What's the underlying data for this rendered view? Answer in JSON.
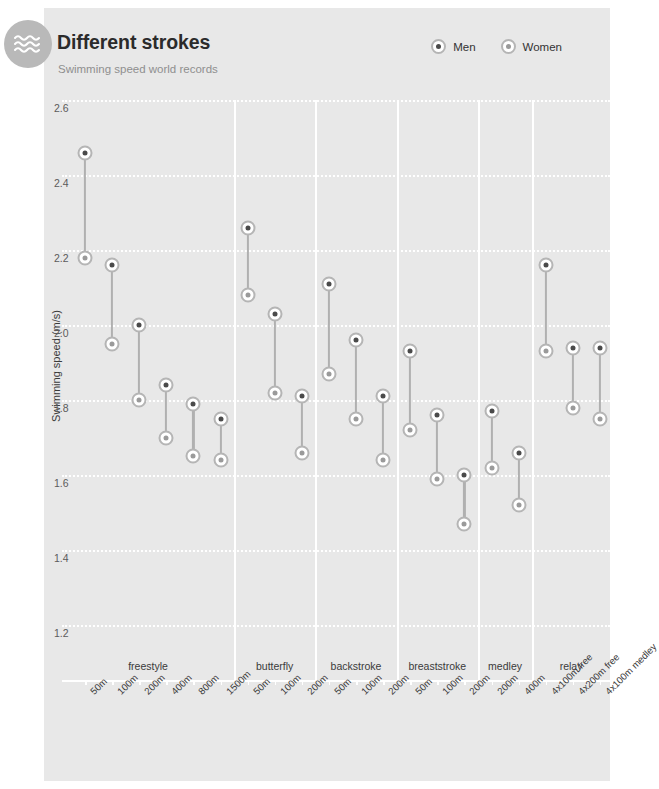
{
  "header": {
    "title": "Different strokes",
    "subtitle": "Swimming speed world records",
    "logo_icon": "waves-icon"
  },
  "legend": {
    "position": "top-right",
    "items": [
      {
        "label": "Men",
        "marker": "filled-dot-circle-icon",
        "color": "#4a4a4a"
      },
      {
        "label": "Women",
        "marker": "light-dot-circle-icon",
        "color": "#9a9a9a"
      }
    ]
  },
  "chart_data": {
    "type": "scatter",
    "title": "Different strokes",
    "subtitle": "Swimming speed world records",
    "xlabel": "",
    "ylabel": "Swimming speed (m/s)",
    "ylim": [
      1.1,
      2.65
    ],
    "yticks": [
      2.6,
      2.4,
      2.2,
      2.0,
      1.8,
      1.6,
      1.4,
      1.2
    ],
    "ytick_labels": [
      "2.6",
      "2.4",
      "2.2",
      "2.0",
      "1.8",
      "1.6",
      "1.4",
      "1.2"
    ],
    "grid": "horizontal-dotted-white",
    "legend": [
      "Men",
      "Women"
    ],
    "groups": [
      {
        "name": "freestyle",
        "events": [
          "50m",
          "100m",
          "200m",
          "400m",
          "800m",
          "1500m"
        ]
      },
      {
        "name": "butterfly",
        "events": [
          "50m",
          "100m",
          "200m"
        ]
      },
      {
        "name": "backstroke",
        "events": [
          "50m",
          "100m",
          "200m"
        ]
      },
      {
        "name": "breaststroke",
        "events": [
          "50m",
          "100m",
          "200m"
        ]
      },
      {
        "name": "medley",
        "events": [
          "200m",
          "400m"
        ]
      },
      {
        "name": "relay",
        "events": [
          "4x100m free",
          "4x200m free",
          "4x100m medley"
        ]
      }
    ],
    "categories": [
      "50m",
      "100m",
      "200m",
      "400m",
      "800m",
      "1500m",
      "50m",
      "100m",
      "200m",
      "50m",
      "100m",
      "200m",
      "50m",
      "100m",
      "200m",
      "200m",
      "400m",
      "4x100m free",
      "4x200m free",
      "4x100m medley"
    ],
    "series": [
      {
        "name": "Men",
        "values": [
          2.46,
          2.16,
          2.0,
          1.84,
          1.79,
          1.75,
          2.26,
          2.03,
          1.81,
          2.11,
          1.96,
          1.81,
          1.93,
          1.76,
          1.6,
          1.77,
          1.66,
          2.16,
          1.94,
          1.94
        ]
      },
      {
        "name": "Women",
        "values": [
          2.18,
          1.95,
          1.8,
          1.7,
          1.65,
          1.64,
          2.08,
          1.82,
          1.66,
          1.87,
          1.75,
          1.64,
          1.72,
          1.59,
          1.47,
          1.62,
          1.52,
          1.93,
          1.78,
          1.75
        ]
      }
    ]
  },
  "colors": {
    "panel_bg": "#e8e8e8",
    "grid": "#ffffff",
    "men_dot": "#4a4a4a",
    "women_dot": "#9a9a9a",
    "marker_ring": "#b5b5b5",
    "connector": "#b0b0b0"
  }
}
